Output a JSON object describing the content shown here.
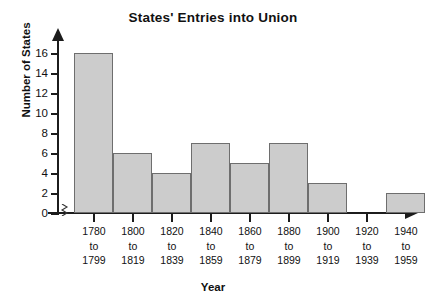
{
  "chart_data": {
    "type": "bar",
    "title": "States' Entries into Union",
    "xlabel": "Year",
    "ylabel": "Number of States",
    "categories": [
      "1780 to 1799",
      "1800 to 1819",
      "1820 to 1839",
      "1840 to 1859",
      "1860 to 1879",
      "1880 to 1899",
      "1900 to 1919",
      "1920 to 1939",
      "1940 to 1959"
    ],
    "category_lines": [
      [
        "1780",
        "to",
        "1799"
      ],
      [
        "1800",
        "to",
        "1819"
      ],
      [
        "1820",
        "to",
        "1839"
      ],
      [
        "1840",
        "to",
        "1859"
      ],
      [
        "1860",
        "to",
        "1879"
      ],
      [
        "1880",
        "to",
        "1899"
      ],
      [
        "1900",
        "to",
        "1919"
      ],
      [
        "1920",
        "to",
        "1939"
      ],
      [
        "1940",
        "to",
        "1959"
      ]
    ],
    "values": [
      16,
      6,
      4,
      7,
      5,
      7,
      3,
      0,
      2
    ],
    "ylim": [
      0,
      17
    ],
    "yticks": [
      0,
      2,
      4,
      6,
      8,
      10,
      12,
      14,
      16
    ],
    "ytick_labels": [
      "0",
      "2",
      "4",
      "6",
      "8",
      "10",
      "12",
      "14",
      "16"
    ],
    "grid": false,
    "legend": "none",
    "bar_fill_color": "#cccccc",
    "bar_edge_color": "#6e6e6e",
    "axis_color": "#1c1c1c",
    "axis_break": true,
    "axis_break_symbol": "≈"
  },
  "figure": {
    "background_color": "#ffffff"
  }
}
